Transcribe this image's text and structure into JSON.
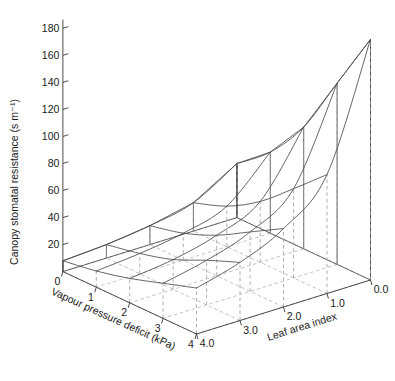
{
  "figure": {
    "title": "",
    "background_color": "#ffffff",
    "mesh_color": "#4a4a4a",
    "grid_color": "#a8a8a8",
    "axis_color": "#3a3a3a"
  },
  "chart_data": {
    "type": "line",
    "plot_kind": "3d-mesh-surface",
    "title": "",
    "xlabel": "Vapour pressure deficit (kPa)",
    "ylabel": "Leaf area index",
    "zlabel": "Canopy stomatal resistance (s m⁻¹)",
    "x": [
      0,
      1,
      2,
      3,
      4
    ],
    "y": [
      0.0,
      1.0,
      2.0,
      3.0,
      4.0
    ],
    "xlim": [
      0,
      4
    ],
    "ylim": [
      0.0,
      4.0
    ],
    "zlim": [
      0,
      180
    ],
    "xticks": [
      "0",
      "1",
      "2",
      "3",
      "4"
    ],
    "yticks": [
      "0.0",
      "1.0",
      "2.0",
      "3.0",
      "4.0"
    ],
    "zticks": [
      "20",
      "40",
      "60",
      "80",
      "100",
      "120",
      "140",
      "160",
      "180"
    ],
    "ztick_values": [
      20,
      40,
      60,
      80,
      100,
      120,
      140,
      160,
      180
    ],
    "grid": true,
    "legend": "none",
    "base_grid": true,
    "stem_lines": true,
    "z_matrix_note": "rows = vapour pressure deficit (kPa) 0..4, cols = leaf area index 0.0..4.0",
    "z": [
      [
        178,
        88,
        58,
        43,
        34
      ],
      [
        134,
        66,
        44,
        33,
        26
      ],
      [
        90,
        45,
        30,
        22,
        18
      ],
      [
        60,
        30,
        20,
        15,
        12
      ],
      [
        40,
        21,
        14,
        10,
        8
      ]
    ]
  },
  "axes": {
    "z_axis": {
      "label": "Canopy stomatal resistance (s m⁻¹)",
      "ticks": [
        "180",
        "160",
        "140",
        "120",
        "100",
        "80",
        "60",
        "40",
        "20"
      ]
    },
    "x_axis": {
      "label": "Vapour pressure deficit (kPa)",
      "ticks": [
        "4",
        "3",
        "2",
        "1",
        "0"
      ]
    },
    "y_axis": {
      "label": "Leaf area index",
      "ticks": [
        "0.0",
        "1.0",
        "2.0",
        "3.0",
        "4.0"
      ]
    }
  }
}
